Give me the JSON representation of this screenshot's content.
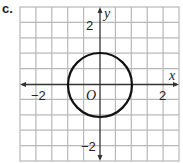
{
  "problem_label": "c.",
  "graph": {
    "x_axis_label": "x",
    "y_axis_label": "y",
    "origin_label": "O",
    "tick_labels": {
      "x_neg": "−2",
      "x_pos": "2",
      "y_pos": "2",
      "y_neg": "−2"
    },
    "grid": {
      "columns": 10,
      "rows": 10,
      "unit_per_cell": 0.5
    },
    "shape": {
      "type": "circle",
      "center": [
        0,
        0
      ],
      "radius": 1
    },
    "colors": {
      "grid": "#b8b8b8",
      "axis": "#333333",
      "curve": "#111111"
    }
  }
}
